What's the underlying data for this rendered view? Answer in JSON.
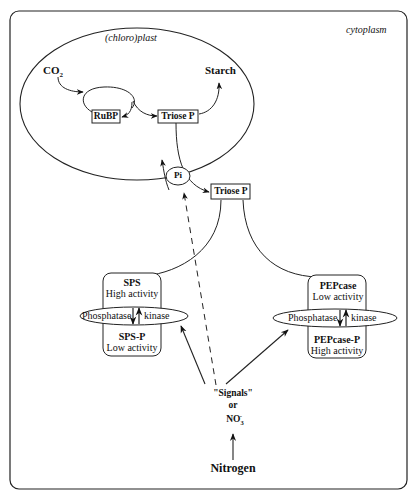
{
  "compartments": {
    "cytoplasm": "cytoplasm",
    "chloroplast": "(chloro)plast"
  },
  "chloroplast": {
    "co2": "CO",
    "co2_sub": "2",
    "starch": "Starch",
    "rubp": "RuBP",
    "triose_p": "Triose P"
  },
  "transport": {
    "pi": "Pi",
    "triose_p_cytoplasm": "Triose P"
  },
  "sps": {
    "name": "SPS",
    "name_activity": "High activity",
    "phos_name": "SPS-P",
    "phos_activity": "Low activity",
    "phosphatase": "Phosphatase",
    "kinase": "kinase"
  },
  "pepcase": {
    "name": "PEPcase",
    "name_activity": "Low activity",
    "phos_name": "PEPcase-P",
    "phos_activity": "High activity",
    "phosphatase": "Phosphatase",
    "kinase": "kinase"
  },
  "signals": {
    "line1": "\"Signals\"",
    "line2": "or",
    "no3": "NO",
    "no3_sub": "3",
    "no3_sup": "-"
  },
  "source": {
    "nitrogen": "Nitrogen"
  }
}
